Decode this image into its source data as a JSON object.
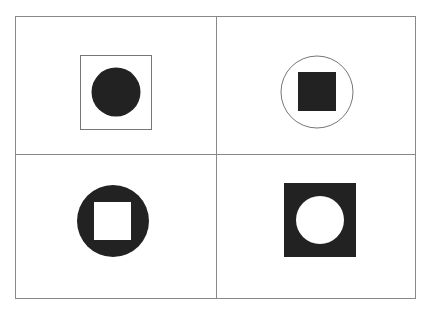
{
  "figure": {
    "colors": {
      "ink": "#222222",
      "line": "#888888",
      "background": "#ffffff"
    },
    "panels": [
      {
        "position": "top-left",
        "outer": "square-outline",
        "inner": "circle-filled"
      },
      {
        "position": "top-right",
        "outer": "circle-outline",
        "inner": "square-filled"
      },
      {
        "position": "bottom-left",
        "outer": "circle-filled",
        "inner": "square-white"
      },
      {
        "position": "bottom-right",
        "outer": "square-filled",
        "inner": "circle-white"
      }
    ]
  }
}
